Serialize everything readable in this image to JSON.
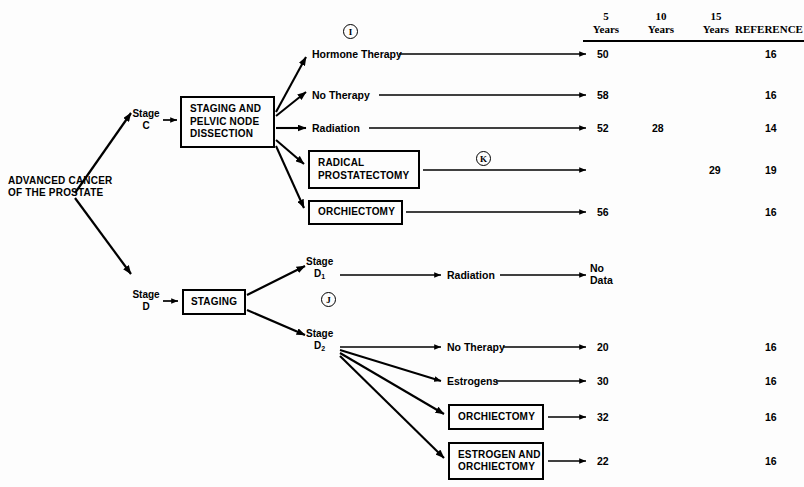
{
  "diagram": {
    "root": {
      "label": "ADVANCED\nCANCER OF THE\nPROSTATE"
    },
    "columns": [
      {
        "id": "years5",
        "label": "5\nYears"
      },
      {
        "id": "years10",
        "label": "10\nYears"
      },
      {
        "id": "years15",
        "label": "15\nYears"
      },
      {
        "id": "reference",
        "label": "REFERENCE"
      }
    ],
    "annotations": [
      {
        "id": "ann-i",
        "text": "I"
      },
      {
        "id": "ann-k",
        "text": "K"
      },
      {
        "id": "ann-j",
        "text": "J"
      }
    ],
    "stages": [
      {
        "id": "stage-c",
        "line1": "Stage",
        "line2": "C",
        "sub": ""
      },
      {
        "id": "stage-d",
        "line1": "Stage",
        "line2": "D",
        "sub": ""
      },
      {
        "id": "stage-d1",
        "line1": "Stage",
        "line2": "D",
        "sub": "1"
      },
      {
        "id": "stage-d2",
        "line1": "Stage",
        "line2": "D",
        "sub": "2"
      }
    ],
    "nodes": [
      {
        "id": "staging-pelvic",
        "label": "STAGING AND\nPELVIC NODE\nDISSECTION",
        "boxed": true
      },
      {
        "id": "staging",
        "label": "STAGING",
        "boxed": true
      }
    ],
    "branches": [
      {
        "id": "hormone-therapy",
        "label": "Hormone Therapy",
        "boxed": false,
        "years5": "50",
        "years10": "",
        "years15": "",
        "reference": "16"
      },
      {
        "id": "no-therapy-c",
        "label": "No Therapy",
        "boxed": false,
        "years5": "58",
        "years10": "",
        "years15": "",
        "reference": "16"
      },
      {
        "id": "radiation-c",
        "label": "Radiation",
        "boxed": false,
        "years5": "52",
        "years10": "28",
        "years15": "",
        "reference": "14"
      },
      {
        "id": "radical-prostatectomy",
        "label": "RADICAL\nPROSTATECTOMY",
        "boxed": true,
        "years5": "",
        "years10": "",
        "years15": "29",
        "reference": "19"
      },
      {
        "id": "orchiectomy-c",
        "label": "ORCHIECTOMY",
        "boxed": true,
        "years5": "56",
        "years10": "",
        "years15": "",
        "reference": "16"
      },
      {
        "id": "radiation-d1",
        "label": "Radiation",
        "boxed": false,
        "years5": "No\nData",
        "years10": "",
        "years15": "",
        "reference": ""
      },
      {
        "id": "no-therapy-d2",
        "label": "No Therapy",
        "boxed": false,
        "years5": "20",
        "years10": "",
        "years15": "",
        "reference": "16"
      },
      {
        "id": "estrogens-d2",
        "label": "Estrogens",
        "boxed": false,
        "years5": "30",
        "years10": "",
        "years15": "",
        "reference": "16"
      },
      {
        "id": "orchiectomy-d2",
        "label": "ORCHIECTOMY",
        "boxed": true,
        "years5": "32",
        "years10": "",
        "years15": "",
        "reference": "16"
      },
      {
        "id": "estrogen-and-orchiectomy-d2",
        "label": "ESTROGEN AND\nORCHIECTOMY",
        "boxed": true,
        "years5": "22",
        "years10": "",
        "years15": "",
        "reference": "16"
      }
    ]
  }
}
